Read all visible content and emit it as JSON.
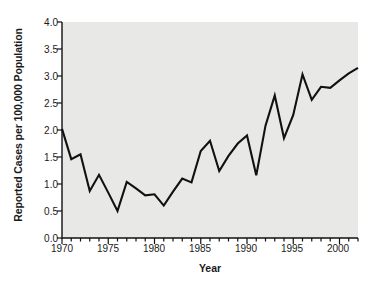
{
  "chart_data": {
    "type": "line",
    "title": "",
    "xlabel": "Year",
    "ylabel": "Reported Cases per 100,000 Population",
    "xlim": [
      1970,
      2002
    ],
    "ylim": [
      0.0,
      4.0
    ],
    "grid": false,
    "legend": null,
    "x_major_ticks": [
      1970,
      1975,
      1980,
      1985,
      1990,
      1995,
      2000
    ],
    "x_major_tick_labels": [
      "1970",
      "1975",
      "1980",
      "1985",
      "1990",
      "1995",
      "2000"
    ],
    "x_minor_tick_interval": 1,
    "y_ticks": [
      0.0,
      0.5,
      1.0,
      1.5,
      2.0,
      2.5,
      3.0,
      3.5,
      4.0
    ],
    "y_tick_labels": [
      "0.0",
      "0.5",
      "1.0",
      "1.5",
      "2.0",
      "2.5",
      "3.0",
      "3.5",
      "4.0"
    ],
    "series": [
      {
        "name": "Reported cases",
        "color": "#111111",
        "line_width": 2.1,
        "x": [
          1970,
          1971,
          1972,
          1973,
          1974,
          1975,
          1976,
          1977,
          1978,
          1979,
          1980,
          1981,
          1982,
          1983,
          1984,
          1985,
          1986,
          1987,
          1988,
          1989,
          1990,
          1991,
          1992,
          1993,
          1994,
          1995,
          1996,
          1997,
          1998,
          1999,
          2000,
          2001,
          2002
        ],
        "values": [
          2.02,
          1.46,
          1.55,
          0.87,
          1.17,
          0.84,
          0.5,
          1.04,
          0.92,
          0.79,
          0.81,
          0.6,
          0.86,
          1.1,
          1.03,
          1.61,
          1.8,
          1.24,
          1.52,
          1.75,
          1.9,
          1.16,
          2.08,
          2.64,
          1.85,
          2.28,
          3.03,
          2.56,
          2.8,
          2.78,
          2.92,
          3.05,
          3.15
        ]
      }
    ]
  },
  "axes": {
    "plot_background": "#e8e8e6",
    "axis_color": "#111111",
    "page_background": "#ffffff"
  }
}
